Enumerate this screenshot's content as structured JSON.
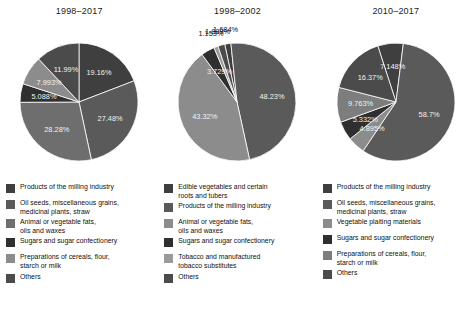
{
  "chart_data": [
    {
      "type": "pie",
      "title": "1998–2017",
      "categories": [
        "Products of the milling industry",
        "Oil seeds, miscellaneous grains, medicinal plants, straw",
        "Animal or vegetable fats, oils and waxes",
        "Sugars and sugar confectionery",
        "Preparations of cereals, flour, starch or milk",
        "Others"
      ],
      "values": [
        19.16,
        27.48,
        28.28,
        5.088,
        7.993,
        11.99
      ],
      "value_labels": [
        "19.16%",
        "27.48%",
        "28.28%",
        "5.088%",
        "7.993%",
        "11.99%"
      ],
      "colors": [
        "#3f3f3f",
        "#5a5a5a",
        "#6e6e6e",
        "#2f2f2f",
        "#8c8c8c",
        "#4b4b4b"
      ],
      "legend_position": "bottom"
    },
    {
      "type": "pie",
      "title": "1998–2002",
      "categories": [
        "Edible vegetables and certain roots and tubers",
        "Products of the milling industry",
        "Animal or vegetable fats, oils and waxes",
        "Sugars and sugar confectionery",
        "Tobacco and manufactured tobacco substitutes",
        "Others"
      ],
      "values": [
        1.684,
        48.23,
        43.32,
        3.729,
        1.153,
        1.889
      ],
      "value_labels": [
        "1.684%",
        "48.23%",
        "43.32%",
        "3.729%",
        "1.153%",
        "1.889%"
      ],
      "colors": [
        "#3f3f3f",
        "#5a5a5a",
        "#8c8c8c",
        "#2f2f2f",
        "#9a9a9a",
        "#4b4b4b"
      ],
      "legend_position": "bottom"
    },
    {
      "type": "pie",
      "title": "2010–2017",
      "categories": [
        "Products of the milling industry",
        "Oil seeds, miscellaneous grains, medicinal plants, straw",
        "Vegetable plaiting materials",
        "Sugars and sugar confectionery",
        "Preparations of cereals, flour, starch or milk",
        "Others"
      ],
      "values": [
        7.148,
        58.7,
        4.895,
        5.332,
        9.763,
        16.37
      ],
      "value_labels": [
        "7.148%",
        "58.7%",
        "4.895%",
        "5.332%",
        "9.763%",
        "16.37%"
      ],
      "colors": [
        "#3f3f3f",
        "#5a5a5a",
        "#8c8c8c",
        "#2f2f2f",
        "#7d7d7d",
        "#4b4b4b"
      ],
      "legend_position": "bottom"
    }
  ],
  "panels": [
    {
      "title": "1998–2017",
      "legend": [
        {
          "label": "Products of the milling industry",
          "color": "#3f3f3f"
        },
        {
          "label": "Oil seeds, miscellaneous grains,\nmedicinal plants, straw",
          "color": "#5a5a5a"
        },
        {
          "label": "Animal or vegetable fats,\noils and waxes",
          "color": "#6e6e6e"
        },
        {
          "label": "Sugars and sugar confectionery",
          "color": "#2f2f2f"
        },
        {
          "label": "Preparations of cereals, flour,\nstarch or milk",
          "color": "#8c8c8c"
        },
        {
          "label": "Others",
          "color": "#4b4b4b"
        }
      ]
    },
    {
      "title": "1998–2002",
      "legend": [
        {
          "label": "Edible vegetables and certain\nroots and tubers",
          "color": "#3f3f3f"
        },
        {
          "label": "Products of the milling industry",
          "color": "#5a5a5a"
        },
        {
          "label": "Animal or vegetable fats,\noils and waxes",
          "color": "#8c8c8c"
        },
        {
          "label": "Sugars and sugar confectionery",
          "color": "#2f2f2f"
        },
        {
          "label": "Tobacco and manufactured\ntobacco substitutes",
          "color": "#9a9a9a"
        },
        {
          "label": "Others",
          "color": "#4b4b4b"
        }
      ]
    },
    {
      "title": "2010–2017",
      "legend": [
        {
          "label": "Products of the milling industry",
          "color": "#3f3f3f"
        },
        {
          "label": "Oil seeds, miscellaneous grains,\nmedicinal plants, straw",
          "color": "#5a5a5a"
        },
        {
          "label": "Vegetable plaiting materials",
          "color": "#8c8c8c"
        },
        {
          "label": "Sugars and sugar confectionery",
          "color": "#2f2f2f"
        },
        {
          "label": "Preparations of cereals, flour,\nstarch or milk",
          "color": "#7d7d7d"
        },
        {
          "label": "Others",
          "color": "#4b4b4b"
        }
      ]
    }
  ]
}
